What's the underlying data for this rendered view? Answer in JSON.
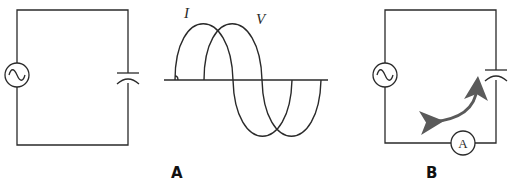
{
  "panels": [
    {
      "id": "A",
      "label": "A",
      "circuit": {
        "components": [
          "ac-source",
          "capacitor"
        ],
        "description": "AC source connected across a capacitor"
      },
      "graph": {
        "curves": [
          {
            "name": "I",
            "label": "I",
            "phase": "leads by 90°"
          },
          {
            "name": "V",
            "label": "V",
            "phase": "reference"
          }
        ],
        "annotation": "right-angle marker at start of I curve"
      }
    },
    {
      "id": "B",
      "label": "B",
      "circuit": {
        "components": [
          "ac-source",
          "capacitor",
          "ammeter"
        ],
        "ammeter_label": "A",
        "arrow": "curved double-headed arrow indicating alternating current flow"
      }
    }
  ],
  "colors": {
    "line": "#2a2a2a",
    "arrow": "#5a5a5a",
    "background": "#ffffff"
  }
}
